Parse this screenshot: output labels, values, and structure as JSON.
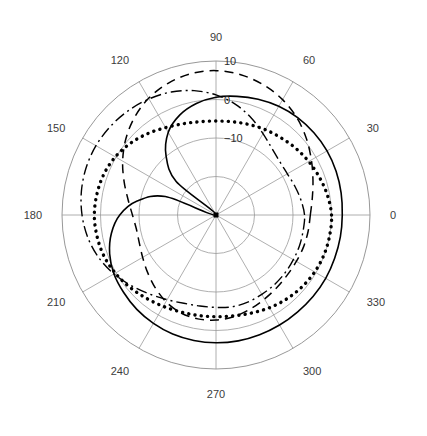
{
  "figure": {
    "type": "polar-antenna-pattern",
    "title": "",
    "background_color": "#ffffff",
    "grid_color": "#9a9a9a",
    "curve_color": "#000000"
  },
  "axes": {
    "angular_labels": [
      "0",
      "30",
      "60",
      "90",
      "120",
      "150",
      "180",
      "210",
      "240",
      "270",
      "300",
      "330"
    ],
    "angular_label_values": [
      0,
      30,
      60,
      90,
      120,
      150,
      180,
      210,
      240,
      270,
      300,
      330
    ],
    "angular_unit": "degrees",
    "radial_labels": [
      "10",
      "0",
      "-10"
    ],
    "radial_label_values": [
      10,
      0,
      -10
    ],
    "radial_unit": "dB",
    "radial_min": -30,
    "radial_max": 10,
    "radial_ring_step": 10,
    "ring_count": 4,
    "grid": "on"
  },
  "chart_data": {
    "type": "line",
    "title": "",
    "xlabel": "Angle (degrees)",
    "ylabel": "Gain (dB)",
    "xlim": [
      0,
      360
    ],
    "ylim": [
      -30,
      10
    ],
    "grid": true,
    "legend": "none",
    "x": [
      0,
      10,
      20,
      30,
      40,
      50,
      60,
      70,
      80,
      90,
      100,
      110,
      120,
      130,
      140,
      150,
      160,
      170,
      180,
      190,
      200,
      210,
      220,
      230,
      240,
      250,
      260,
      270,
      280,
      290,
      300,
      310,
      320,
      330,
      340,
      350,
      360
    ],
    "series": [
      {
        "name": "solid",
        "style": "solid",
        "values": [
          2.8,
          3.0,
          3.2,
          3.3,
          3.2,
          3.0,
          2.6,
          2.0,
          1.3,
          0.6,
          -0.6,
          -2.4,
          -5.2,
          -9.8,
          -16.5,
          -30.0,
          -16.0,
          -9.2,
          -5.0,
          -2.4,
          -0.6,
          0.6,
          1.3,
          2.0,
          2.5,
          2.9,
          3.1,
          3.2,
          3.2,
          3.1,
          3.0,
          2.9,
          2.9,
          2.9,
          2.8,
          2.8,
          2.8
        ]
      },
      {
        "name": "dashed",
        "style": "dashed",
        "values": [
          -5.5,
          -4.6,
          -3.2,
          -1.4,
          0.7,
          2.8,
          4.6,
          6.0,
          7.0,
          7.5,
          7.3,
          6.4,
          5.0,
          3.0,
          0.6,
          -2.0,
          -4.6,
          -6.8,
          -8.3,
          -9.0,
          -8.8,
          -8.0,
          -6.8,
          -5.4,
          -4.0,
          -3.0,
          -2.6,
          -2.7,
          -3.2,
          -4.0,
          -4.8,
          -5.4,
          -5.8,
          -5.9,
          -5.8,
          -5.7,
          -5.5
        ]
      },
      {
        "name": "dash-dot",
        "style": "dash-dot",
        "values": [
          -7.0,
          -7.6,
          -8.2,
          -8.6,
          -8.4,
          -7.4,
          -5.6,
          -3.2,
          -0.8,
          1.2,
          2.8,
          4.0,
          4.8,
          5.4,
          5.8,
          6.0,
          5.9,
          5.5,
          4.8,
          3.8,
          2.4,
          0.6,
          -1.4,
          -3.2,
          -4.6,
          -5.6,
          -6.0,
          -6.0,
          -5.8,
          -5.9,
          -6.2,
          -6.4,
          -6.6,
          -6.8,
          -6.9,
          -7.0,
          -7.0
        ]
      },
      {
        "name": "dotted",
        "style": "dotted",
        "values": [
          0.0,
          -0.6,
          -1.4,
          -2.2,
          -3.0,
          -3.8,
          -4.4,
          -5.0,
          -5.4,
          -5.6,
          -5.4,
          -4.8,
          -3.8,
          -2.4,
          -1.0,
          0.2,
          1.0,
          1.4,
          1.6,
          1.4,
          1.0,
          0.2,
          -0.8,
          -1.8,
          -2.6,
          -3.2,
          -3.5,
          -3.6,
          -3.4,
          -2.9,
          -2.2,
          -1.5,
          -0.9,
          -0.4,
          -0.1,
          0.0,
          0.0
        ]
      }
    ]
  },
  "geometry": {
    "center_x": 216,
    "center_y": 215,
    "outer_radius": 154
  }
}
